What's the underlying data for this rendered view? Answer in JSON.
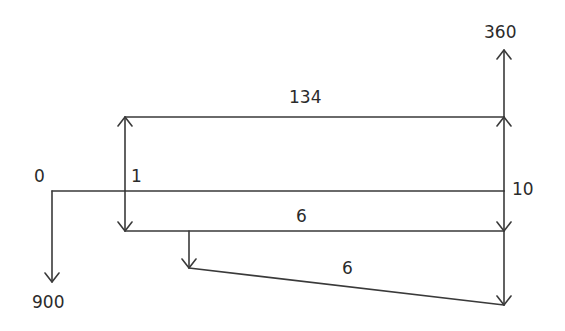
{
  "diagram": {
    "type": "cash-flow-diagram",
    "line_color": "#3a3a3a",
    "labels": {
      "time_start": "0",
      "time_one": "1",
      "time_end": "10",
      "initial_outflow": "900",
      "final_inflow": "360",
      "annual_inflow": "134",
      "annual_cost": "6",
      "gradient_cost": "6"
    }
  }
}
